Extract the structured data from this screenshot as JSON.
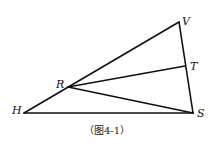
{
  "figure": {
    "caption": "（图4-1）",
    "points": {
      "H": {
        "label": "H",
        "x": 24,
        "y": 113
      },
      "S": {
        "label": "S",
        "x": 193,
        "y": 113
      },
      "V": {
        "label": "V",
        "x": 179,
        "y": 22
      },
      "T": {
        "label": "T",
        "x": 185,
        "y": 66
      },
      "R": {
        "label": "R",
        "x": 68,
        "y": 87
      }
    },
    "segments": [
      [
        "H",
        "S"
      ],
      [
        "H",
        "V"
      ],
      [
        "V",
        "S"
      ],
      [
        "R",
        "T"
      ],
      [
        "R",
        "S"
      ]
    ],
    "line_color": "#111111"
  }
}
